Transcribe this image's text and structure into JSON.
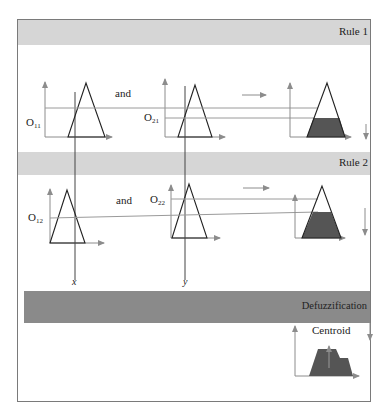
{
  "diagram": {
    "colors": {
      "frame": "#7a7a7a",
      "rule_band": "#d6d6d6",
      "defuzz_band": "#8a8a8a",
      "fill": "#555555",
      "arrow": "#8c8c8c",
      "line": "#333333",
      "guide": "#9a9a9a"
    },
    "rules": [
      {
        "label": "Rule 1",
        "connector": "and",
        "inputs": [
          {
            "label_main": "O",
            "label_sub": "11"
          },
          {
            "label_main": "O",
            "label_sub": "21"
          }
        ]
      },
      {
        "label": "Rule 2",
        "connector": "and",
        "inputs": [
          {
            "label_main": "O",
            "label_sub": "12"
          },
          {
            "label_main": "O",
            "label_sub": "22"
          }
        ]
      }
    ],
    "input_variables": [
      "x",
      "y"
    ],
    "defuzzification": {
      "label": "Defuzzification",
      "method": "Centroid"
    }
  }
}
